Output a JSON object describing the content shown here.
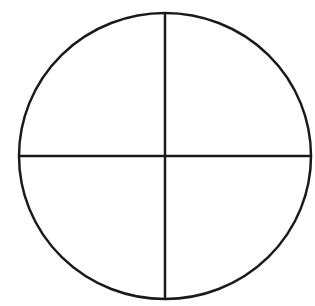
{
  "diagram": {
    "type": "circle-divided-into-quadrants",
    "stroke_color": "#1a1a1a",
    "background_color": "#ffffff",
    "circle": {
      "cx": 165,
      "cy": 156,
      "rx": 146,
      "ry": 143
    },
    "lines": [
      {
        "name": "vertical-diameter",
        "x1": 165,
        "y1": 13,
        "x2": 165,
        "y2": 299
      },
      {
        "name": "horizontal-diameter",
        "x1": 19,
        "y1": 156,
        "x2": 311,
        "y2": 156
      }
    ],
    "parts": 4
  }
}
